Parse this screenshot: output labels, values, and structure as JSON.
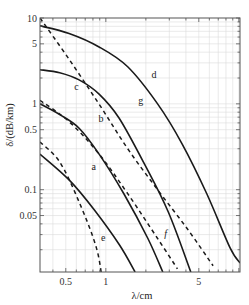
{
  "chart_data": {
    "type": "line",
    "title": "",
    "xlabel": "λ/cm",
    "ylabel": "δ/(dB/km)",
    "xscale": "log",
    "yscale": "log",
    "xlim": [
      0.32,
      10.2
    ],
    "ylim": [
      0.011,
      10
    ],
    "grid": true,
    "legend": "none (inline curve labels)",
    "xticks": [
      {
        "value": 0.5,
        "label": "0.5"
      },
      {
        "value": 1,
        "label": "1"
      },
      {
        "value": 5,
        "label": "5"
      }
    ],
    "yticks": [
      {
        "value": 10,
        "label": "10"
      },
      {
        "value": 5,
        "label": "5"
      },
      {
        "value": 1,
        "label": "1"
      },
      {
        "value": 0.5,
        "label": "0.5"
      },
      {
        "value": 0.1,
        "label": "0.1"
      },
      {
        "value": 0.05,
        "label": "0.05"
      }
    ],
    "series": [
      {
        "name": "a",
        "style": "solid",
        "x": [
          0.32,
          0.53,
          0.82,
          1.26,
          1.66
        ],
        "y": [
          0.26,
          0.13,
          0.058,
          0.023,
          0.011
        ],
        "label_at": [
          0.78,
          0.17
        ]
      },
      {
        "name": "b",
        "style": "solid",
        "x": [
          0.32,
          0.45,
          0.63,
          0.89,
          1.37,
          2.07,
          2.68
        ],
        "y": [
          1.0,
          0.75,
          0.52,
          0.26,
          0.089,
          0.027,
          0.011
        ],
        "label_at": [
          0.88,
          0.62
        ]
      },
      {
        "name": "c",
        "style": "solid",
        "x": [
          0.32,
          0.45,
          0.63,
          0.89,
          1.26,
          1.95,
          2.95,
          4.35
        ],
        "y": [
          2.5,
          2.3,
          1.9,
          1.3,
          0.68,
          0.2,
          0.055,
          0.011
        ],
        "label_at": [
          0.58,
          1.45
        ]
      },
      {
        "name": "d",
        "style": "solid",
        "x": [
          0.32,
          0.53,
          0.89,
          1.46,
          2.45,
          3.75,
          5.75,
          8.6,
          10.2
        ],
        "y": [
          8.1,
          6.6,
          4.6,
          2.7,
          1.0,
          0.34,
          0.089,
          0.021,
          0.014
        ],
        "label_at": [
          2.2,
          2.0
        ]
      },
      {
        "name": "e",
        "style": "dashed",
        "x": [
          0.32,
          0.45,
          0.63,
          0.85,
          0.95,
          1.0
        ],
        "y": [
          0.36,
          0.21,
          0.072,
          0.021,
          0.008,
          0.0058
        ],
        "label_at": [
          0.92,
          0.025
        ]
      },
      {
        "name": "f",
        "style": "dashed",
        "x": [
          0.32,
          0.53,
          0.89,
          1.46,
          2.45,
          3.45
        ],
        "y": [
          1.1,
          0.62,
          0.26,
          0.09,
          0.027,
          0.012
        ],
        "label_at": [
          2.75,
          0.028
        ]
      },
      {
        "name": "g",
        "style": "dashed",
        "x": [
          0.32,
          0.53,
          0.89,
          1.46,
          2.45,
          4.1,
          6.4
        ],
        "y": [
          10.0,
          3.3,
          0.99,
          0.3,
          0.1,
          0.035,
          0.013
        ],
        "label_at": [
          1.75,
          1.0
        ]
      }
    ]
  },
  "plot_box": {
    "left": 40,
    "right": 240,
    "top": 18,
    "bottom": 272
  },
  "colors": {
    "curve": "#1a1a1a",
    "axis": "#555555",
    "grid": "#dcdcdc"
  }
}
